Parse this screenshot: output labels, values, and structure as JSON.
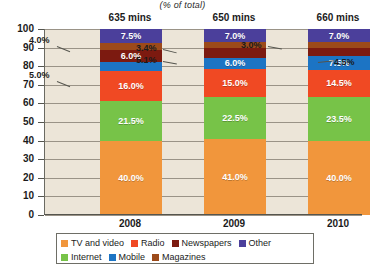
{
  "subtitle": "(% of total)",
  "axis": {
    "y_ticks": [
      "100",
      "90",
      "80",
      "70",
      "60",
      "50",
      "40",
      "30",
      "20",
      "10",
      "0"
    ],
    "y_min": 0,
    "y_max": 100
  },
  "groups": [
    {
      "year": "2008",
      "mins": "635 mins"
    },
    {
      "year": "2009",
      "mins": "650 mins"
    },
    {
      "year": "2010",
      "mins": "660 mins"
    }
  ],
  "legend": {
    "row1": [
      {
        "label": "TV and video",
        "color": "#F1963C"
      },
      {
        "label": "Radio",
        "color": "#F04923"
      },
      {
        "label": "Newspapers",
        "color": "#7C1A10"
      },
      {
        "label": "Other",
        "color": "#4B3F9B"
      }
    ],
    "row2": [
      {
        "label": "Internet",
        "color": "#77C348"
      },
      {
        "label": "Mobile",
        "color": "#1C74C4"
      },
      {
        "label": "Magazines",
        "color": "#9C4A1A"
      }
    ]
  },
  "callouts": [
    {
      "text": "4.0%",
      "x": 29,
      "y": 35
    },
    {
      "text": "5.0%",
      "x": 29,
      "y": 70
    },
    {
      "text": "3.4%",
      "x": 136,
      "y": 43
    },
    {
      "text": "5.1%",
      "x": 136,
      "y": 55
    },
    {
      "text": "3.0%",
      "x": 241,
      "y": 40
    },
    {
      "text": "4.5%",
      "x": 334,
      "y": 57
    }
  ],
  "chart_data": {
    "type": "bar",
    "subtype": "stacked-bar-100",
    "title": "",
    "subtitle": "(% of total)",
    "xlabel": "",
    "ylabel": "",
    "ylim": [
      0,
      100
    ],
    "grid": true,
    "legend_position": "bottom",
    "categories": [
      "2008",
      "2009",
      "2010"
    ],
    "category_notes": [
      "635 mins",
      "650 mins",
      "660 mins"
    ],
    "series": [
      {
        "name": "TV and video",
        "color": "#F1963C",
        "values": [
          40.0,
          41.0,
          40.0
        ],
        "labels": [
          "40.0%",
          "41.0%",
          "40.0%"
        ],
        "label_inside": [
          true,
          true,
          true
        ]
      },
      {
        "name": "Internet",
        "color": "#77C348",
        "values": [
          21.5,
          22.5,
          23.5
        ],
        "labels": [
          "21.5%",
          "22.5%",
          "23.5%"
        ],
        "label_inside": [
          true,
          true,
          true
        ]
      },
      {
        "name": "Radio",
        "color": "#F04923",
        "values": [
          16.0,
          15.0,
          14.5
        ],
        "labels": [
          "16.0%",
          "15.0%",
          "14.5%"
        ],
        "label_inside": [
          true,
          true,
          true
        ]
      },
      {
        "name": "Mobile",
        "color": "#1C74C4",
        "values": [
          5.0,
          6.0,
          7.5
        ],
        "labels": [
          "5.0%",
          "6.0%",
          "7.5%"
        ],
        "label_inside": [
          false,
          true,
          true
        ]
      },
      {
        "name": "Newspapers",
        "color": "#7C1A10",
        "values": [
          6.0,
          5.1,
          4.5
        ],
        "labels": [
          "6.0%",
          "5.1%",
          "4.5%"
        ],
        "label_inside": [
          true,
          false,
          false
        ]
      },
      {
        "name": "Magazines",
        "color": "#9C4A1A",
        "values": [
          4.0,
          3.4,
          3.0
        ],
        "labels": [
          "4.0%",
          "3.4%",
          "3.0%"
        ],
        "label_inside": [
          false,
          false,
          false
        ]
      },
      {
        "name": "Other",
        "color": "#4B3F9B",
        "values": [
          7.5,
          7.0,
          7.0
        ],
        "labels": [
          "7.5%",
          "7.0%",
          "7.0%"
        ],
        "label_inside": [
          true,
          true,
          true
        ]
      }
    ]
  }
}
